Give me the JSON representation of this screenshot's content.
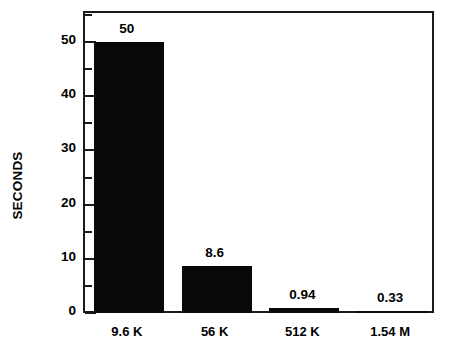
{
  "chart_data": {
    "type": "bar",
    "title": "",
    "subtitle": "",
    "xlabel": "",
    "ylabel": "SECONDS",
    "categories": [
      "9.6 K",
      "56 K",
      "512 K",
      "1.54 M"
    ],
    "values": [
      50,
      8.6,
      0.94,
      0.33
    ],
    "value_labels": [
      "50",
      "8.6",
      "0.94",
      "0.33"
    ],
    "ylim": [
      0,
      55
    ],
    "ytick_labels": [
      "0",
      "10",
      "20",
      "30",
      "40",
      "50"
    ],
    "ytick_values": [
      0,
      10,
      20,
      30,
      40,
      50
    ],
    "yminor_tick_values": [
      5,
      15,
      25,
      35,
      45,
      55
    ],
    "grid": false,
    "legend": null,
    "legend_position": "none",
    "bar_color": "#080808",
    "axis_color": "#1a1a1a",
    "background_color": "#ffffff",
    "orientation": "vertical",
    "note": "Bar heights are scaled so the 50-value bar tops at the 50 tick; the visible plot area extends above to about 55 seconds."
  },
  "colors": {
    "bar": "#080808",
    "axis": "#1a1a1a",
    "text": "#000000",
    "background": "#ffffff"
  }
}
